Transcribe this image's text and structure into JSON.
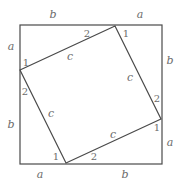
{
  "figure": {
    "colors": {
      "stroke": "#4a4a4a",
      "label": "#6b6b6b",
      "background": "#ffffff"
    },
    "outer_square": {
      "x1": 20,
      "y1": 25,
      "x2": 162,
      "y2": 164
    },
    "inner_square": {
      "vertices": [
        [
          115,
          26
        ],
        [
          161,
          119
        ],
        [
          66,
          163
        ],
        [
          20,
          70
        ]
      ]
    },
    "labels": {
      "top_b": "b",
      "top_a": "a",
      "right_b": "b",
      "right_a": "a",
      "bottom_a": "a",
      "bottom_b": "b",
      "left_a": "a",
      "left_b": "b",
      "side_c_top": "c",
      "side_c_right": "c",
      "side_c_bottom": "c",
      "side_c_left": "c",
      "angle_top_2": "2",
      "angle_top_1": "1",
      "angle_right_2": "2",
      "angle_right_1": "1",
      "angle_bottom_1": "1",
      "angle_bottom_2": "2",
      "angle_left_1": "1",
      "angle_left_2": "2"
    }
  }
}
